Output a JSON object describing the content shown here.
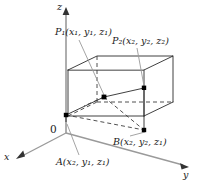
{
  "figure": {
    "background": "#ffffff",
    "stroke_color": "#262626",
    "dash_color": "#4a4a4a",
    "point_color": "#000000",
    "leader_color": "#8c8c8c",
    "axes": {
      "z_label": "z",
      "y_label": "y",
      "x_label": "x",
      "origin_label": "0"
    },
    "labels": {
      "p1": {
        "name": "P",
        "index": "1",
        "coords": "(x₁, y₁, z₁)",
        "full": "P₁(x₁, y₁, z₁)"
      },
      "p2": {
        "name": "P",
        "index": "2",
        "coords": "(x₂, y₂, z₂)",
        "full": "P₂(x₂, y₂, z₂)"
      },
      "a": {
        "name": "A",
        "index": "",
        "coords": "(x₂, y₁, z₁)",
        "full": "A(x₂, y₁, z₁)"
      },
      "b": {
        "name": "B",
        "index": "",
        "coords": "(x₂, y₂, z₁)",
        "full": "B(x₂, y₂, z₁)"
      }
    },
    "points": [
      {
        "id": "P1",
        "x": 104,
        "y": 97
      },
      {
        "id": "P2",
        "x": 144,
        "y": 88
      },
      {
        "id": "A",
        "x": 66,
        "y": 115
      },
      {
        "id": "B",
        "x": 144,
        "y": 130
      }
    ],
    "box": {
      "top_front_left": [
        68,
        70
      ],
      "top_back_left": [
        97,
        56
      ],
      "top_back_right": [
        173,
        56
      ],
      "top_front_right": [
        144,
        70
      ],
      "bot_front_left": [
        68,
        116
      ],
      "bot_back_left": [
        97,
        102
      ],
      "bot_back_right": [
        173,
        102
      ],
      "bot_front_right": [
        144,
        116
      ]
    }
  }
}
